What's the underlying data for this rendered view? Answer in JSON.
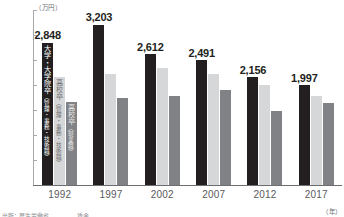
{
  "chart_data": {
    "type": "bar",
    "title": "",
    "xlabel": "（年）",
    "ylabel": "（万円）",
    "ylim": [
      0,
      3500
    ],
    "yticks": [
      "0",
      "500",
      "1,000",
      "1,500",
      "2,000",
      "2,500",
      "3,000",
      "3,500"
    ],
    "ytick_values": [
      0,
      500,
      1000,
      1500,
      2000,
      2500,
      3000,
      3500
    ],
    "grid": false,
    "legend_position": "in-bars-first-group",
    "categories": [
      "1992",
      "1997",
      "2002",
      "2007",
      "2012",
      "2017"
    ],
    "series": [
      {
        "name": "大学・大学院卒（管理・事務・技術職）",
        "color": "#231f20",
        "values": [
          2848,
          3203,
          2612,
          2491,
          2156,
          1997
        ],
        "labels": [
          "2,848",
          "3,203",
          "2,612",
          "2,491",
          "2,156",
          "1,997"
        ]
      },
      {
        "name": "高校卒（管理・事務・技術職）",
        "color": "#d6d7d8",
        "values": [
          2170,
          2230,
          2340,
          2230,
          2010,
          1780
        ],
        "labels": [
          "",
          "",
          "",
          "",
          "",
          ""
        ]
      },
      {
        "name": "高校卒（現業職）",
        "color": "#808285",
        "values": [
          1670,
          1740,
          1780,
          1900,
          1480,
          1640
        ],
        "labels": [
          "",
          "",
          "",
          "",
          "",
          ""
        ]
      }
    ],
    "inbar_labels": [
      {
        "main": "大学・大学院卒",
        "sub": "（管理・事務・技術職）"
      },
      {
        "main": "高校卒",
        "sub": "（管理・事務・技術職）"
      },
      {
        "main": "高校卒",
        "sub": "（現業職）"
      }
    ]
  },
  "source": {
    "note": "出所：厚生労働省　　　　　賃金"
  }
}
